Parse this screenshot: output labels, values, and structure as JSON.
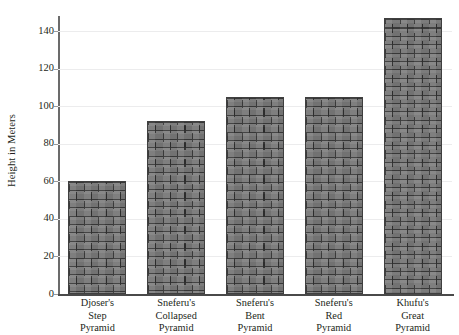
{
  "chart_data": {
    "type": "bar",
    "title": "",
    "xlabel": "",
    "ylabel": "Height in Meters",
    "ylim": [
      0,
      148
    ],
    "yticks": [
      0,
      20,
      40,
      60,
      80,
      100,
      120,
      140
    ],
    "grid": true,
    "legend": null,
    "categories": [
      "Djoser's\nStep\nPyramid",
      "Sneferu's\nCollapsed\nPyramid",
      "Sneferu's\nBent\nPyramid",
      "Sneferu's\nRed\nPyramid",
      "Khufu's\nGreat\nPyramid"
    ],
    "values": [
      60,
      92,
      105,
      105,
      147
    ],
    "bar_fill_color": "#7d7d7d",
    "bar_edge_color": "#3f3f3f",
    "bar_texture": "brick"
  },
  "axes": {
    "y_title": "Height in Meters",
    "y_tick_labels": [
      "140",
      "120",
      "100",
      "80",
      "60",
      "40",
      "20",
      "0"
    ],
    "axis_line_color": "#5a5a5a",
    "gridline_color": "#ececed"
  }
}
